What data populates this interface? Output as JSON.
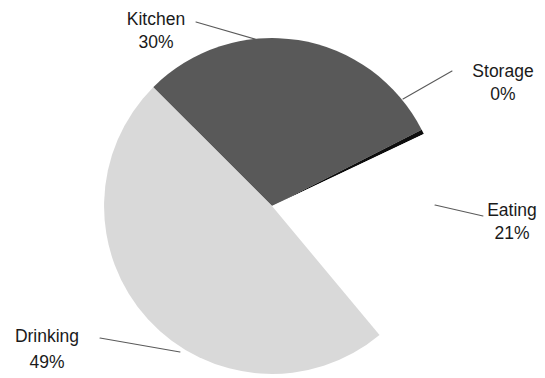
{
  "chart_data": {
    "type": "pie",
    "title": "",
    "subtitle": "",
    "xlabel": "",
    "ylabel": "",
    "legend_position": "none",
    "grid": false,
    "labels_show_percent": true,
    "categories": [
      "Kitchen",
      "Storage",
      "Eating",
      "Drinking"
    ],
    "values": [
      30,
      0,
      21,
      49
    ],
    "slices": [
      {
        "name": "Kitchen",
        "value": 30,
        "percent_label": "30%",
        "color": "#595959",
        "start_angle_deg": -135.0,
        "end_angle_deg": -27.0,
        "label_text": "Kitchen",
        "label_x": 156,
        "label_y": 20,
        "value_x": 156,
        "value_y": 43,
        "label_anchor": "middle",
        "leader": [
          [
            196,
            22
          ],
          [
            258,
            40
          ]
        ]
      },
      {
        "name": "Storage",
        "value": 0,
        "percent_label": "0%",
        "color": "#0d0d0d",
        "start_angle_deg": -27.0,
        "end_angle_deg": -25.4,
        "label_text": "Storage",
        "label_x": 503,
        "label_y": 72,
        "value_x": 503,
        "value_y": 95,
        "label_anchor": "middle",
        "leader": [
          [
            403,
            99
          ],
          [
            452,
            71
          ]
        ]
      },
      {
        "name": "Eating",
        "value": 21,
        "percent_label": "21%",
        "color": "#ffffff",
        "start_angle_deg": -25.4,
        "end_angle_deg": 50.2,
        "label_text": "Eating",
        "label_x": 512,
        "label_y": 211,
        "value_x": 512,
        "value_y": 234,
        "label_anchor": "middle",
        "leader": [
          [
            435,
            205
          ],
          [
            483,
            216
          ]
        ]
      },
      {
        "name": "Drinking",
        "value": 49,
        "percent_label": "49%",
        "color": "#d9d9d9",
        "start_angle_deg": 50.2,
        "end_angle_deg": 225.0,
        "label_text": "Drinking",
        "label_x": 47,
        "label_y": 337,
        "value_x": 47,
        "value_y": 363,
        "label_anchor": "middle",
        "leader": [
          [
            100,
            338
          ],
          [
            180,
            352
          ]
        ]
      }
    ],
    "geometry": {
      "center_x": 272,
      "center_y": 206,
      "radius": 168
    },
    "background_color": "#ffffff"
  }
}
